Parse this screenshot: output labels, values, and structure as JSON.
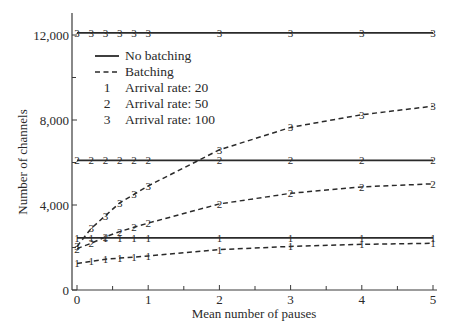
{
  "chart_data": {
    "type": "line",
    "title": "",
    "xlabel": "Mean number of pauses",
    "ylabel": "Number of channels",
    "xlim": [
      0,
      5
    ],
    "ylim": [
      0,
      13000
    ],
    "x_ticks": [
      0,
      1,
      2,
      3,
      4,
      5
    ],
    "x_tick_labels": [
      "0",
      "1",
      "2",
      "3",
      "4",
      "5"
    ],
    "x_minor_ticks": [
      0.5,
      1.5,
      2.5,
      3.5,
      4.5
    ],
    "y_ticks": [
      0,
      4000,
      8000,
      12000
    ],
    "y_tick_labels": [
      "0",
      "4,000",
      "8,000",
      "12,000"
    ],
    "y_minor_ticks": [
      2000,
      6000,
      10000
    ],
    "grid": false,
    "legend_position": "upper-left",
    "legend": [
      {
        "style": "solid",
        "label": "No batching"
      },
      {
        "style": "dashed",
        "label": "Batching"
      },
      {
        "marker": "1",
        "label": "Arrival rate: 20"
      },
      {
        "marker": "2",
        "label": "Arrival rate: 50"
      },
      {
        "marker": "3",
        "label": "Arrival rate: 100"
      }
    ],
    "x": [
      0,
      0.2,
      0.4,
      0.6,
      0.8,
      1,
      2,
      3,
      4,
      5
    ],
    "series": [
      {
        "name": "No batching, Arrival rate: 20",
        "style": "solid",
        "marker": "1",
        "values": [
          2450,
          2450,
          2450,
          2450,
          2450,
          2450,
          2450,
          2450,
          2450,
          2450
        ]
      },
      {
        "name": "No batching, Arrival rate: 50",
        "style": "solid",
        "marker": "2",
        "values": [
          6100,
          6100,
          6100,
          6100,
          6100,
          6100,
          6100,
          6100,
          6100,
          6100
        ]
      },
      {
        "name": "No batching, Arrival rate: 100",
        "style": "solid",
        "marker": "3",
        "values": [
          12100,
          12100,
          12100,
          12100,
          12100,
          12100,
          12100,
          12100,
          12100,
          12100
        ]
      },
      {
        "name": "Batching, Arrival rate: 20",
        "style": "dashed",
        "marker": "1",
        "values": [
          1250,
          1350,
          1450,
          1500,
          1550,
          1600,
          1900,
          2050,
          2150,
          2200
        ]
      },
      {
        "name": "Batching, Arrival rate: 50",
        "style": "dashed",
        "marker": "2",
        "values": [
          1950,
          2200,
          2500,
          2750,
          2950,
          3150,
          4050,
          4550,
          4850,
          5000
        ]
      },
      {
        "name": "Batching, Arrival rate: 100",
        "style": "dashed",
        "marker": "3",
        "values": [
          2050,
          2900,
          3500,
          4100,
          4500,
          4900,
          6600,
          7650,
          8250,
          8650
        ]
      }
    ]
  },
  "colors": {
    "line": "#2a2a2a",
    "axis": "#3a3a3a",
    "background": "#ffffff"
  }
}
